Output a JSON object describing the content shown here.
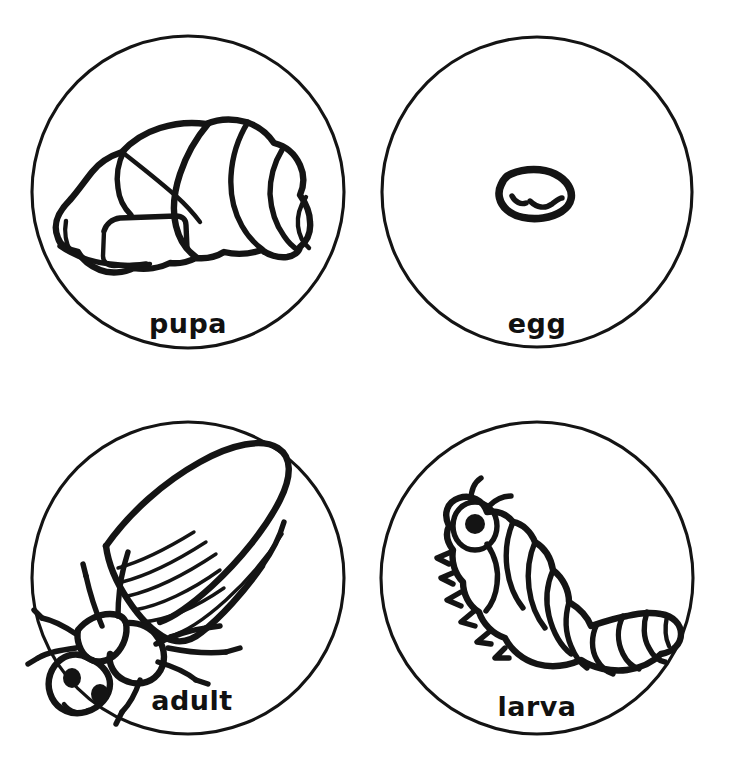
{
  "page": {
    "background_color": "#ffffff",
    "ink_color": "#141414",
    "layout": "2x2 grid of circular picture cards",
    "width": 731,
    "height": 772
  },
  "cards": [
    {
      "id": "pupa",
      "label": "pupa",
      "icon_name": "pupa-illustration",
      "position": "top-left",
      "circle": {
        "cx": 188,
        "cy": 192,
        "r": 156
      },
      "description": "Segmented pupa / cocoon drawn in side view"
    },
    {
      "id": "egg",
      "label": "egg",
      "icon_name": "egg-illustration",
      "position": "top-right",
      "circle": {
        "cx": 537,
        "cy": 192,
        "r": 155
      },
      "description": "Small oval egg at center of circle"
    },
    {
      "id": "adult",
      "label": "adult",
      "icon_name": "adult-beetle-illustration",
      "position": "bottom-left",
      "circle": {
        "cx": 188,
        "cy": 578,
        "r": 156
      },
      "description": "Adult winged beetle with legs, antennae and two eyes"
    },
    {
      "id": "larva",
      "label": "larva",
      "icon_name": "larva-illustration",
      "position": "bottom-right",
      "circle": {
        "cx": 537,
        "cy": 578,
        "r": 156
      },
      "description": "Segmented caterpillar-like larva with antennae and legs"
    }
  ]
}
